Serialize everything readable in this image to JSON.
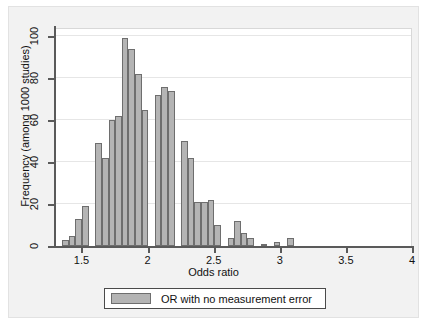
{
  "chart_data": {
    "type": "bar",
    "title": "",
    "subtitle": "",
    "xlabel": "Odds ratio",
    "ylabel": "Frequency (among 1000 studies)",
    "xlim": [
      1.3,
      4.0
    ],
    "ylim": [
      0,
      104
    ],
    "grid": true,
    "grid_axis": "y",
    "legend_position": "bottom-center",
    "bar_color": "#b4b4b4",
    "bar_edge_color": "#6e6e6e",
    "bin_width": 0.05,
    "xticks": [
      1.5,
      2,
      2.5,
      3,
      3.5,
      4
    ],
    "xtick_labels": [
      "1.5",
      "2",
      "2.5",
      "3",
      "3.5",
      "4"
    ],
    "yticks": [
      0,
      20,
      40,
      60,
      80,
      100
    ],
    "ytick_labels": [
      "0",
      "20",
      "40",
      "60",
      "80",
      "100"
    ],
    "series": [
      {
        "name": "OR with no measurement error",
        "bin_left_edges": [
          1.35,
          1.4,
          1.45,
          1.5,
          1.55,
          1.6,
          1.65,
          1.7,
          1.75,
          1.8,
          1.85,
          1.9,
          1.95,
          2.0,
          2.05,
          2.1,
          2.15,
          2.2,
          2.25,
          2.3,
          2.35,
          2.4,
          2.45,
          2.5,
          2.55,
          2.6,
          2.65,
          2.7,
          2.75,
          2.8,
          2.85,
          2.95,
          3.05
        ],
        "values": [
          3,
          5,
          13,
          19,
          49,
          42,
          60,
          62,
          99,
          94,
          82,
          65,
          72,
          76,
          74,
          50,
          42,
          21,
          21,
          22,
          10,
          4,
          12,
          6,
          4,
          1,
          2,
          4,
          0,
          0,
          0,
          0,
          0
        ]
      }
    ],
    "bars": [
      {
        "left": 1.355,
        "value": 3
      },
      {
        "left": 1.405,
        "value": 5
      },
      {
        "left": 1.455,
        "value": 13
      },
      {
        "left": 1.505,
        "value": 19
      },
      {
        "left": 1.605,
        "value": 49
      },
      {
        "left": 1.655,
        "value": 42
      },
      {
        "left": 1.705,
        "value": 60
      },
      {
        "left": 1.755,
        "value": 62
      },
      {
        "left": 1.805,
        "value": 99
      },
      {
        "left": 1.855,
        "value": 94
      },
      {
        "left": 1.905,
        "value": 82
      },
      {
        "left": 1.955,
        "value": 65
      },
      {
        "left": 2.055,
        "value": 72
      },
      {
        "left": 2.105,
        "value": 76
      },
      {
        "left": 2.155,
        "value": 74
      },
      {
        "left": 2.255,
        "value": 50
      },
      {
        "left": 2.305,
        "value": 42
      },
      {
        "left": 2.355,
        "value": 21
      },
      {
        "left": 2.405,
        "value": 21
      },
      {
        "left": 2.455,
        "value": 22
      },
      {
        "left": 2.505,
        "value": 10
      },
      {
        "left": 2.605,
        "value": 4
      },
      {
        "left": 2.655,
        "value": 12
      },
      {
        "left": 2.705,
        "value": 6
      },
      {
        "left": 2.755,
        "value": 4
      },
      {
        "left": 2.855,
        "value": 1
      },
      {
        "left": 2.955,
        "value": 2
      },
      {
        "left": 3.055,
        "value": 4
      }
    ],
    "legend": [
      {
        "label": "OR with no measurement error",
        "color": "#b4b4b4"
      }
    ]
  },
  "axes": {
    "x_title": "Odds ratio",
    "y_title": "Frequency (among 1000 studies)"
  },
  "legend": {
    "entry_label": "OR with no measurement error"
  }
}
